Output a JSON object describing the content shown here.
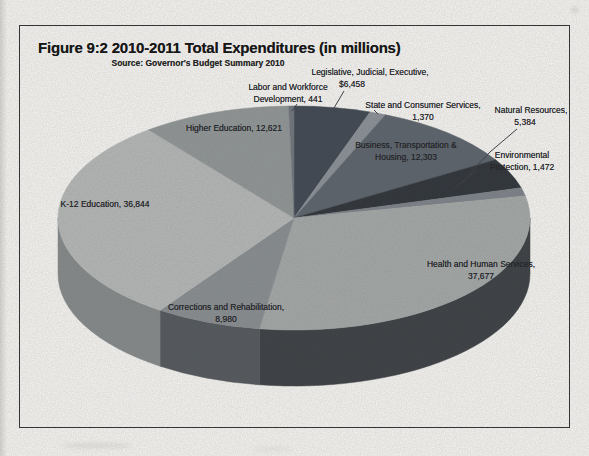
{
  "figure": {
    "title": "Figure 9:2 2010-2011 Total Expenditures (in millions)",
    "source": "Source: Governor's Budget Summary 2010"
  },
  "chart_data": {
    "type": "pie",
    "style": "3d",
    "title": "2010-2011 Total Expenditures (in millions)",
    "source": "Governor's Budget Summary 2010",
    "unit": "millions of dollars",
    "total": 123550,
    "start_angle_deg": -90,
    "direction": "clockwise",
    "legend_position": "none",
    "labels_on_chart": true,
    "slices": [
      {
        "label": "Legislative, Judicial, Executive",
        "value": 6458,
        "display": "Legislative, Judicial, Executive, $6,458",
        "color": "#3f4650",
        "wall": "#23272d"
      },
      {
        "label": "State and Consumer Services",
        "value": 1370,
        "display": "State and Consumer Services, 1,370",
        "color": "#8a9097",
        "wall": "#555a60"
      },
      {
        "label": "Business, Transportation & Housing",
        "value": 12303,
        "display": "Business, Transportation & Housing, 12,303",
        "color": "#5b626a",
        "wall": "#363b41"
      },
      {
        "label": "Natural Resources",
        "value": 5384,
        "display": "Natural Resources, 5,384",
        "color": "#2d3238",
        "wall": "#1b1f24"
      },
      {
        "label": "Environmental Protection",
        "value": 1472,
        "display": "Environmental Protection, 1,472",
        "color": "#7d8289",
        "wall": "#4c5056"
      },
      {
        "label": "Health and Human Services",
        "value": 37677,
        "display": "Health and Human Services, 37,677",
        "color": "#a4a8a7",
        "wall": "#3a3e42"
      },
      {
        "label": "Corrections and Rehabilitation",
        "value": 8980,
        "display": "Corrections and Rehabilitation, 8,980",
        "color": "#888d90",
        "wall": "#52575b"
      },
      {
        "label": "K-12 Education",
        "value": 36844,
        "display": "K-12 Education, 36,844",
        "color": "#b5b8b6",
        "wall": "#85898a"
      },
      {
        "label": "Higher Education",
        "value": 12621,
        "display": "Higher Education, 12,621",
        "color": "#909595",
        "wall": "#5e6265"
      },
      {
        "label": "Labor and Workforce Development",
        "value": 441,
        "display": "Labor and Workforce Development, 441",
        "color": "#6f747b",
        "wall": "#44484e"
      }
    ]
  },
  "annotations": {
    "labels": [
      {
        "id": "legislative-judicial-executive",
        "x": 370,
        "y": 66,
        "lines": [
          {
            "t": "Legislative, Judicial, Executive,"
          },
          {
            "t": "$6,458",
            "dx": -18
          }
        ]
      },
      {
        "id": "labor-workforce-development",
        "x": 288,
        "y": 81,
        "lines": [
          {
            "t": "Labor and Workforce"
          },
          {
            "t": "Development, 441"
          }
        ]
      },
      {
        "id": "state-consumer-services",
        "x": 423,
        "y": 99,
        "lines": [
          {
            "t": "State and Consumer Services,"
          },
          {
            "t": "1,370"
          }
        ]
      },
      {
        "id": "natural-resources",
        "x": 531,
        "y": 104,
        "lines": [
          {
            "t": "Natural Resources,"
          },
          {
            "t": "5,384",
            "dx": -6
          }
        ]
      },
      {
        "id": "higher-education",
        "x": 234,
        "y": 122,
        "lines": [
          {
            "t": "Higher Education, 12,621"
          }
        ]
      },
      {
        "id": "business-transportation-housing",
        "x": 406,
        "y": 139,
        "lines": [
          {
            "t": "Business, Transportation &"
          },
          {
            "t": "Housing, 12,303"
          }
        ]
      },
      {
        "id": "environmental-protection",
        "x": 522,
        "y": 149,
        "lines": [
          {
            "t": "Environmental"
          },
          {
            "t": "Protection, 1,472"
          }
        ]
      },
      {
        "id": "k12-education",
        "x": 105,
        "y": 198,
        "lines": [
          {
            "t": "K-12 Education, 36,844"
          }
        ]
      },
      {
        "id": "health-human-services",
        "x": 481,
        "y": 258,
        "lines": [
          {
            "t": "Health and Human Services,"
          },
          {
            "t": "37,677"
          }
        ]
      },
      {
        "id": "corrections-rehabilitation",
        "x": 226,
        "y": 301,
        "lines": [
          {
            "t": "Corrections and Rehabilitation,"
          },
          {
            "t": "8,980"
          }
        ]
      }
    ],
    "leaders": [
      [
        [
          344,
          91
        ],
        [
          334,
          108
        ]
      ],
      [
        [
          297,
          104
        ],
        [
          292,
          111
        ]
      ],
      [
        [
          374,
          110
        ],
        [
          378,
          114
        ]
      ],
      [
        [
          517,
          129
        ],
        [
          490,
          152
        ],
        [
          468,
          175
        ]
      ],
      [
        [
          477,
          170
        ],
        [
          455,
          188
        ]
      ]
    ]
  }
}
